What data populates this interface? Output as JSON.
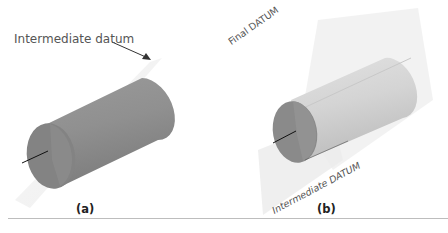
{
  "figure": {
    "panels": [
      {
        "id": "a",
        "caption": "(a)",
        "annotation": "Intermediate datum",
        "has_arrow": true
      },
      {
        "id": "b",
        "caption": "(b)",
        "plane_labels": [
          "Final DATUM",
          "Intermediate DATUM"
        ]
      }
    ],
    "colors": {
      "cylinder_a_body": "#8f8f8f",
      "cylinder_a_end": "#7e7e7e",
      "cylinder_b_body": "#d2d2d2",
      "cylinder_b_end": "#8a8a8a",
      "plane": "#ececec",
      "axis": "#111111",
      "text": "#555555",
      "rule": "#bdbdbd"
    }
  }
}
